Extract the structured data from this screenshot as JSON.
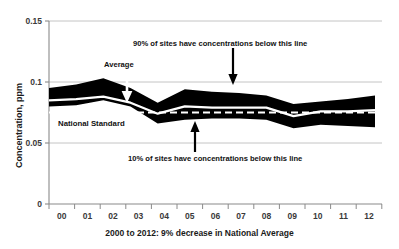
{
  "chart_data": {
    "type": "area",
    "title": "",
    "xlabel": "2000 to 2012: 9% decrease in National Average",
    "ylabel": "Concentration, ppm",
    "categories": [
      "00",
      "01",
      "02",
      "03",
      "04",
      "05",
      "06",
      "07",
      "08",
      "09",
      "10",
      "11",
      "12"
    ],
    "x_full_years": [
      2000,
      2001,
      2002,
      2003,
      2004,
      2005,
      2006,
      2007,
      2008,
      2009,
      2010,
      2011,
      2012
    ],
    "ylim": [
      0,
      0.15
    ],
    "yticks": [
      "0",
      "0.05",
      "0.1",
      "0.15"
    ],
    "ytick_values": [
      0,
      0.05,
      0.1,
      0.15
    ],
    "grid": "horizontal",
    "legend": "none",
    "series": [
      {
        "name": "90th percentile",
        "description": "90% of sites have concentrations below this line",
        "values": [
          0.095,
          0.098,
          0.103,
          0.095,
          0.083,
          0.094,
          0.092,
          0.091,
          0.089,
          0.082,
          0.084,
          0.086,
          0.089
        ]
      },
      {
        "name": "Average",
        "description": "National Average concentration",
        "values": [
          0.085,
          0.086,
          0.088,
          0.083,
          0.074,
          0.08,
          0.079,
          0.079,
          0.079,
          0.072,
          0.076,
          0.076,
          0.077
        ]
      },
      {
        "name": "10th percentile",
        "description": "10% of sites have concentrations below this line",
        "values": [
          0.08,
          0.081,
          0.085,
          0.08,
          0.066,
          0.069,
          0.07,
          0.07,
          0.069,
          0.062,
          0.065,
          0.064,
          0.063
        ]
      },
      {
        "name": "National Standard",
        "description": "National Standard reference level (dashed)",
        "values": [
          0.075,
          0.075,
          0.075,
          0.075,
          0.075,
          0.075,
          0.075,
          0.075,
          0.075,
          0.075,
          0.075,
          0.075,
          0.075
        ]
      }
    ],
    "annotations": [
      {
        "id": "upper-band-note",
        "text": "90% of sites have concentrations below this line"
      },
      {
        "id": "lower-band-note",
        "text": "10% of sites have concentrations below this line"
      },
      {
        "id": "average-note",
        "text": "Average"
      },
      {
        "id": "standard-note",
        "text": "National Standard"
      }
    ],
    "colors": {
      "band": "#000000",
      "average_line": "#ffffff",
      "standard_line": "#ffffff",
      "grid": "#c9c9c9",
      "axis": "#8a8a8a",
      "text": "#111111",
      "background": "#ffffff"
    }
  },
  "axes": {
    "y_title": "Concentration, ppm",
    "x_title": "2000 to 2012: 9% decrease in National Average",
    "y_ticks": [
      {
        "label": "0.15"
      },
      {
        "label": "0.1"
      },
      {
        "label": "0.05"
      },
      {
        "label": "0"
      }
    ],
    "x_ticks": [
      {
        "label": "00"
      },
      {
        "label": "01"
      },
      {
        "label": "02"
      },
      {
        "label": "03"
      },
      {
        "label": "04"
      },
      {
        "label": "05"
      },
      {
        "label": "06"
      },
      {
        "label": "07"
      },
      {
        "label": "08"
      },
      {
        "label": "09"
      },
      {
        "label": "10"
      },
      {
        "label": "11"
      },
      {
        "label": "12"
      }
    ]
  },
  "annotations": {
    "upper": "90% of sites have concentrations below this line",
    "lower": "10% of sites have concentrations below this line",
    "average": "Average",
    "standard": "National Standard"
  }
}
